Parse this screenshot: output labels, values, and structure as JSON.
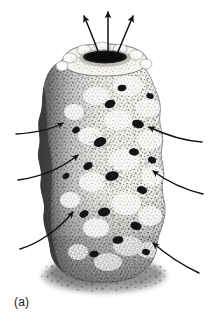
{
  "figure": {
    "label": "(a)",
    "background_color": "#ffffff",
    "ink_color": "#151515",
    "width": 208,
    "height": 332
  },
  "organism": {
    "name": "sponge-body",
    "shape": "upright cylindrical vase",
    "surface": "stippled porous wall with many dark ostia openings",
    "top_opening": {
      "name": "osculum",
      "shape": "dark ellipse",
      "cx": 105,
      "cy": 58,
      "rx": 26,
      "ry": 9
    },
    "shading": {
      "lit_side": "right",
      "shadow_side": "left",
      "base": "encrusting shadowed holdfast spreading onto substrate"
    },
    "bounds": {
      "left": 38,
      "right": 170,
      "top": 44,
      "bottom": 282
    }
  },
  "flow_arrows": {
    "outflow": {
      "label_role": "excurrent water leaving the osculum",
      "count": 3,
      "arrows": [
        {
          "name": "outflow-arrow-left",
          "x1": 100,
          "y1": 57,
          "x2": 84,
          "y2": 14,
          "curve": -7
        },
        {
          "name": "outflow-arrow-center",
          "x1": 108,
          "y1": 56,
          "x2": 108,
          "y2": 10,
          "curve": 0
        },
        {
          "name": "outflow-arrow-right",
          "x1": 116,
          "y1": 57,
          "x2": 132,
          "y2": 14,
          "curve": 7
        }
      ]
    },
    "inflow": {
      "label_role": "incurrent water entering the ostia",
      "count": 6,
      "arrows": [
        {
          "name": "inflow-arrow-left-upper",
          "x1": 18,
          "y1": 133,
          "x2": 63,
          "y2": 124,
          "curve": 4
        },
        {
          "name": "inflow-arrow-left-middle",
          "x1": 20,
          "y1": 178,
          "x2": 78,
          "y2": 155,
          "curve": 5
        },
        {
          "name": "inflow-arrow-left-lower",
          "x1": 22,
          "y1": 248,
          "x2": 73,
          "y2": 211,
          "curve": 6
        },
        {
          "name": "inflow-arrow-right-upper",
          "x1": 199,
          "y1": 141,
          "x2": 148,
          "y2": 127,
          "curve": -5
        },
        {
          "name": "inflow-arrow-right-middle",
          "x1": 201,
          "y1": 193,
          "x2": 152,
          "y2": 171,
          "curve": -6
        },
        {
          "name": "inflow-arrow-right-lower",
          "x1": 197,
          "y1": 272,
          "x2": 152,
          "y2": 242,
          "curve": -6
        }
      ]
    }
  }
}
